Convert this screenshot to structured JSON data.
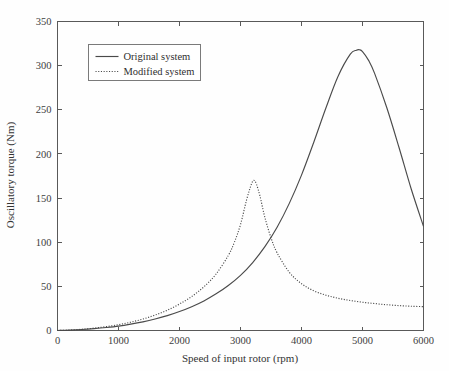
{
  "figure": {
    "background_color": "#fefefe",
    "frame_color": "#595959",
    "line_color": "#4a4a4a"
  },
  "chart_data": {
    "type": "line",
    "title": "",
    "subtitle": "",
    "xlabel": "Speed of input rotor (rpm)",
    "ylabel": "Oscillatory torque (Nm)",
    "xlim": [
      0,
      6000
    ],
    "ylim": [
      0,
      350
    ],
    "xticks": [
      0,
      1000,
      2000,
      3000,
      4000,
      5000,
      6000
    ],
    "yticks": [
      0,
      50,
      100,
      150,
      200,
      250,
      300,
      350
    ],
    "xtick_labels": [
      "0",
      "1000",
      "2000",
      "3000",
      "4000",
      "5000",
      "6000"
    ],
    "ytick_labels": [
      "0",
      "50",
      "100",
      "150",
      "200",
      "250",
      "300",
      "350"
    ],
    "grid": false,
    "legend_position": "upper left (inside axes)",
    "annotations": [],
    "series": [
      {
        "name": "Original system",
        "style": "solid",
        "color": "#4a4a4a",
        "peak_x": 4950,
        "peak_y": 318,
        "end_y_at_6000": 118,
        "x": [
          0,
          200,
          400,
          600,
          800,
          1000,
          1200,
          1400,
          1600,
          1800,
          2000,
          2200,
          2400,
          2600,
          2800,
          3000,
          3200,
          3400,
          3600,
          3800,
          4000,
          4200,
          4400,
          4600,
          4800,
          4900,
          4950,
          5000,
          5100,
          5200,
          5400,
          5600,
          5800,
          6000
        ],
        "y": [
          0,
          0.4,
          1.1,
          2.1,
          3.4,
          5.0,
          7.2,
          9.8,
          13.0,
          16.8,
          21.5,
          27.0,
          33.5,
          41.5,
          51.0,
          62.5,
          77.0,
          95.0,
          117.0,
          144.0,
          176.0,
          213.0,
          252.0,
          288.0,
          313.0,
          317.5,
          318.0,
          316.0,
          306.0,
          291.0,
          252.0,
          207.0,
          160.0,
          118.0
        ]
      },
      {
        "name": "Modified system",
        "style": "dotted",
        "color": "#4a4a4a",
        "peak_x": 3220,
        "peak_y": 170,
        "end_y_at_6000": 27,
        "x": [
          0,
          200,
          400,
          600,
          800,
          1000,
          1200,
          1400,
          1600,
          1800,
          2000,
          2200,
          2400,
          2600,
          2800,
          2900,
          3000,
          3100,
          3180,
          3220,
          3260,
          3320,
          3400,
          3500,
          3600,
          3800,
          4000,
          4200,
          4400,
          4600,
          4800,
          5000,
          5200,
          5400,
          5600,
          5800,
          6000
        ],
        "y": [
          0,
          0.5,
          1.4,
          2.7,
          4.4,
          6.6,
          9.4,
          13.0,
          17.5,
          23.0,
          30.0,
          38.5,
          49.5,
          64.0,
          85.0,
          100.0,
          120.0,
          148.0,
          166.0,
          170.0,
          166.0,
          152.0,
          128.0,
          105.0,
          88.0,
          66.0,
          53.0,
          45.0,
          40.0,
          36.5,
          34.0,
          32.0,
          30.5,
          29.2,
          28.2,
          27.5,
          27.0
        ]
      }
    ]
  }
}
